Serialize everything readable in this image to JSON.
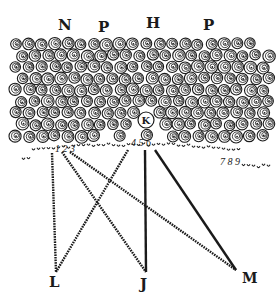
{
  "figure": {
    "type": "engraving",
    "ink_color": "#1a1a1a",
    "paper_color": "#ffffff",
    "top_labels": [
      "N",
      "P",
      "H",
      "P"
    ],
    "marked_cell_label": "K",
    "edge_numerals": [
      {
        "group": "left",
        "text": "1 2 3"
      },
      {
        "group": "center",
        "text": "4 5 6"
      },
      {
        "group": "right",
        "text": "7 8 9"
      }
    ],
    "focal_points": [
      "L",
      "J",
      "M"
    ],
    "rays": [
      {
        "from": "1",
        "to": "L",
        "style": "dotted"
      },
      {
        "from": "2",
        "to": "J",
        "style": "dotted"
      },
      {
        "from": "3",
        "to": "M",
        "style": "dotted"
      },
      {
        "from": "4",
        "to": "L",
        "style": "dotted"
      },
      {
        "from": "5",
        "to": "J",
        "style": "solid"
      },
      {
        "from": "6",
        "to": "M",
        "style": "solid"
      }
    ]
  }
}
